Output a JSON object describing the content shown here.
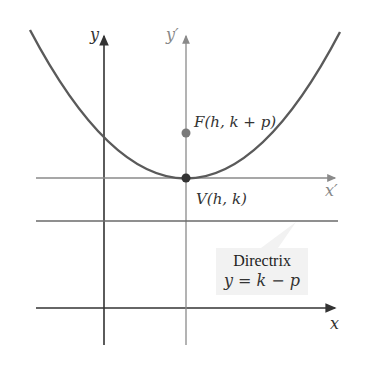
{
  "diagram": {
    "type": "parabola-translated-axes",
    "axes": {
      "x_label": "x",
      "y_label": "y",
      "x_prime_label": "x′",
      "y_prime_label": "y′"
    },
    "points": {
      "focus": {
        "label": "F(h, k + p)"
      },
      "vertex": {
        "label": "V(h, k)"
      }
    },
    "directrix": {
      "title": "Directrix",
      "equation": "y = k − p"
    },
    "colors": {
      "curve": "#5a5a5a",
      "axis": "#333333",
      "prime_axis": "#8a8a8a",
      "focus": "#7a7a7a",
      "vertex": "#333333",
      "callout_bg": "#f2f2f2"
    }
  }
}
